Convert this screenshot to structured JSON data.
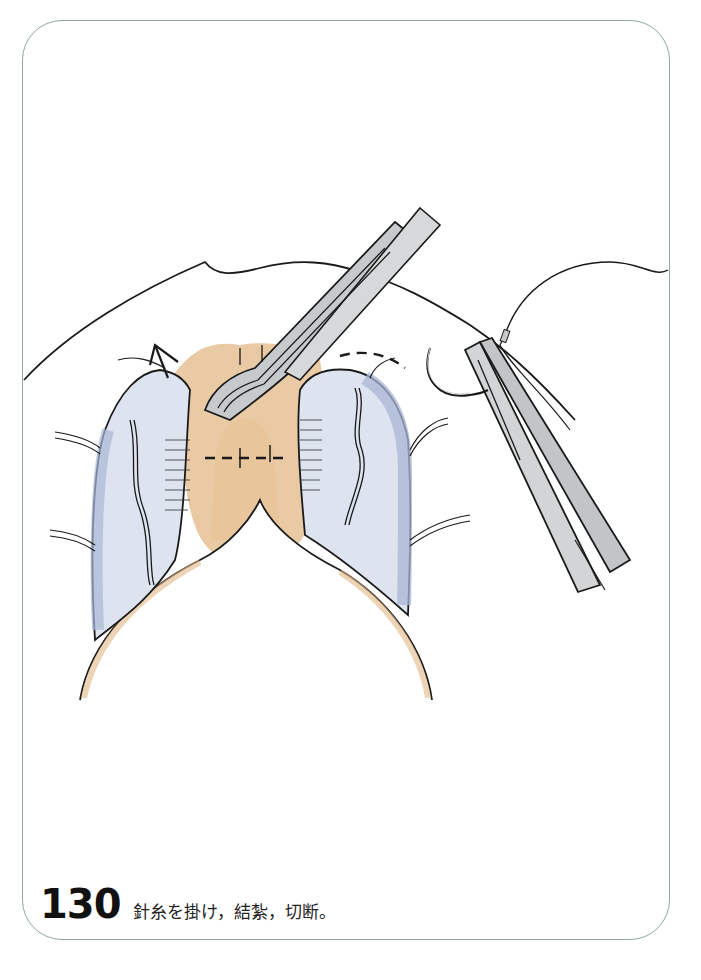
{
  "figure": {
    "number": "130",
    "caption": "針糸を掛け，結紮，切断。",
    "frame_color": "#8fa99a",
    "colors": {
      "skin_tan": "#e2b887",
      "mucosa_blue": "#a9b6d6",
      "instrument_gray": "#c7cacc",
      "ink": "#1a1a1a"
    },
    "elements": [
      "forceps-holding-tissue",
      "needle-holder-with-curved-needle",
      "suture-thread",
      "ligature-dashed-lines",
      "left-retracted-flap",
      "right-retracted-flap",
      "upward-arrow"
    ]
  }
}
